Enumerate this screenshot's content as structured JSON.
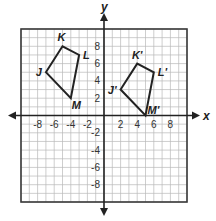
{
  "diagram": {
    "type": "coordinate-plane-translation",
    "axes": {
      "x_label": "x",
      "y_label": "y",
      "x_range": [
        -10,
        10
      ],
      "y_range": [
        -10,
        10
      ],
      "grid_step": 1,
      "x_tick_labels": [
        "-8",
        "-6",
        "-4",
        "-2",
        "2",
        "4",
        "6",
        "8"
      ],
      "x_tick_values": [
        -8,
        -6,
        -4,
        -2,
        2,
        4,
        6,
        8
      ],
      "y_tick_labels": [
        "8",
        "6",
        "4",
        "2",
        "-2",
        "-4",
        "-6",
        "-8"
      ],
      "y_tick_values": [
        8,
        6,
        4,
        2,
        -2,
        -4,
        -6,
        -8
      ]
    },
    "preimage": {
      "name": "JKLM",
      "vertices": [
        {
          "label": "J",
          "x": -7,
          "y": 5
        },
        {
          "label": "K",
          "x": -5,
          "y": 8
        },
        {
          "label": "L",
          "x": -3,
          "y": 7
        },
        {
          "label": "M",
          "x": -4,
          "y": 2
        }
      ]
    },
    "image": {
      "name": "J'K'L'M'",
      "vertices": [
        {
          "label": "J'",
          "x": 2,
          "y": 3
        },
        {
          "label": "K'",
          "x": 4,
          "y": 6
        },
        {
          "label": "L'",
          "x": 6,
          "y": 5
        },
        {
          "label": "M'",
          "x": 5,
          "y": 0
        }
      ]
    },
    "colors": {
      "grid": "#b9b9b9",
      "border": "#3a3a3a",
      "stroke": "#222222"
    }
  }
}
